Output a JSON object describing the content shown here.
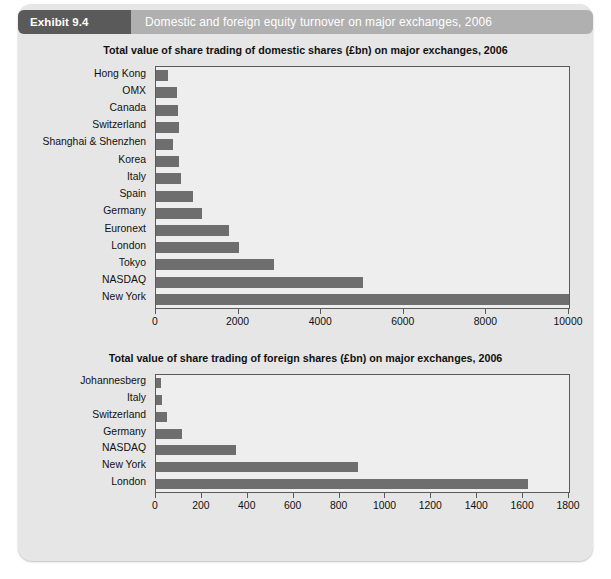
{
  "header": {
    "badge": "Exhibit 9.4",
    "title": "Domestic and foreign equity turnover on major exchanges, 2006",
    "badge_color": "#5a5a5a",
    "bar_color": "#b0b0b0"
  },
  "panel": {
    "background": "#e6e6e6",
    "bar_color": "#6e6e6e",
    "plot_background": "#eeeeee",
    "axis_color": "#5a5a5a"
  },
  "chart_data": [
    {
      "type": "bar",
      "orientation": "horizontal",
      "title": "Total value of share trading of domestic shares (£bn) on major exchanges, 2006",
      "xlabel": "",
      "ylabel": "",
      "xlim": [
        0,
        10000
      ],
      "xticks": [
        0,
        2000,
        4000,
        6000,
        8000,
        10000
      ],
      "xticklabels": [
        "0",
        "2000",
        "4000",
        "6000",
        "8000",
        "10000"
      ],
      "grid": false,
      "legend": null,
      "categories": [
        "Hong Kong",
        "OMX",
        "Canada",
        "Switzerland",
        "Shanghai & Shenzhen",
        "Korea",
        "Italy",
        "Spain",
        "Germany",
        "Euronext",
        "London",
        "Tokyo",
        "NASDAQ",
        "New York"
      ],
      "values": [
        300,
        510,
        530,
        550,
        410,
        545,
        615,
        905,
        1115,
        1775,
        2015,
        2845,
        5000,
        10000
      ]
    },
    {
      "type": "bar",
      "orientation": "horizontal",
      "title": "Total value of share trading of foreign shares (£bn) on major exchanges, 2006",
      "xlabel": "",
      "ylabel": "",
      "xlim": [
        0,
        1800
      ],
      "xticks": [
        0,
        200,
        400,
        600,
        800,
        1000,
        1200,
        1400,
        1600,
        1800
      ],
      "xticklabels": [
        "0",
        "200",
        "400",
        "600",
        "800",
        "1000",
        "1200",
        "1400",
        "1600",
        "1800"
      ],
      "grid": false,
      "legend": null,
      "categories": [
        "Johannesberg",
        "Italy",
        "Switzerland",
        "Germany",
        "NASDAQ",
        "New York",
        "London"
      ],
      "values": [
        22,
        26,
        48,
        115,
        350,
        880,
        1620
      ]
    }
  ]
}
